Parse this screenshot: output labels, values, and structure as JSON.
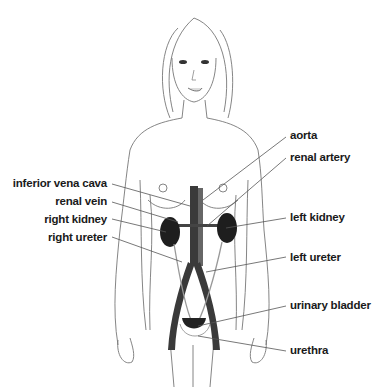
{
  "diagram": {
    "colors": {
      "outline": "#777777",
      "organ": "#222222",
      "vessel": "#3a3a3a",
      "label": "#1a1a1a"
    },
    "labels_left": [
      {
        "text": "inferior vena cava"
      },
      {
        "text": "renal vein"
      },
      {
        "text": "right kidney"
      },
      {
        "text": "right ureter"
      }
    ],
    "labels_right": [
      {
        "text": "aorta"
      },
      {
        "text": "renal artery"
      },
      {
        "text": "left kidney"
      },
      {
        "text": "left ureter"
      },
      {
        "text": "urinary bladder"
      },
      {
        "text": "urethra"
      }
    ]
  }
}
